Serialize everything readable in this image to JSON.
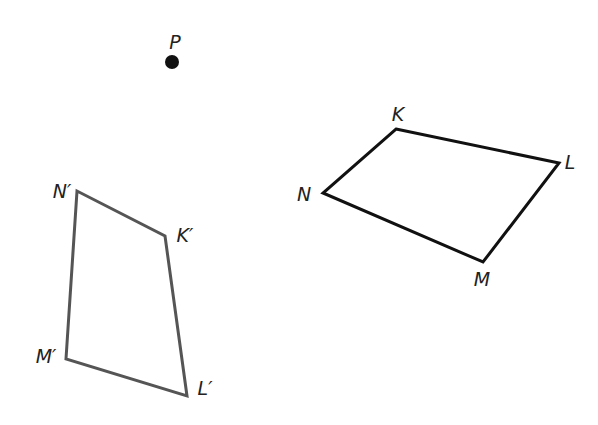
{
  "diagram": {
    "type": "geometric-transformation",
    "point": {
      "label": "P",
      "x": 172,
      "y": 62,
      "color": "#111111"
    },
    "original_quadrilateral": {
      "name": "KLMN",
      "stroke": "#111111",
      "vertices": [
        {
          "label": "K",
          "x": 396,
          "y": 129,
          "lx": 398,
          "ly": 121
        },
        {
          "label": "L",
          "x": 559,
          "y": 163,
          "lx": 570,
          "ly": 169
        },
        {
          "label": "M",
          "x": 483,
          "y": 262,
          "lx": 482,
          "ly": 286
        },
        {
          "label": "N",
          "x": 323,
          "y": 193,
          "lx": 304,
          "ly": 201
        }
      ]
    },
    "image_quadrilateral": {
      "name": "K'L'M'N'",
      "stroke": "#555555",
      "vertices": [
        {
          "label": "K′",
          "x": 165,
          "y": 236,
          "lx": 185,
          "ly": 242
        },
        {
          "label": "L′",
          "x": 187,
          "y": 396,
          "lx": 205,
          "ly": 395
        },
        {
          "label": "M′",
          "x": 66,
          "y": 359,
          "lx": 46,
          "ly": 363
        },
        {
          "label": "N′",
          "x": 77,
          "y": 191,
          "lx": 62,
          "ly": 198
        }
      ]
    }
  }
}
